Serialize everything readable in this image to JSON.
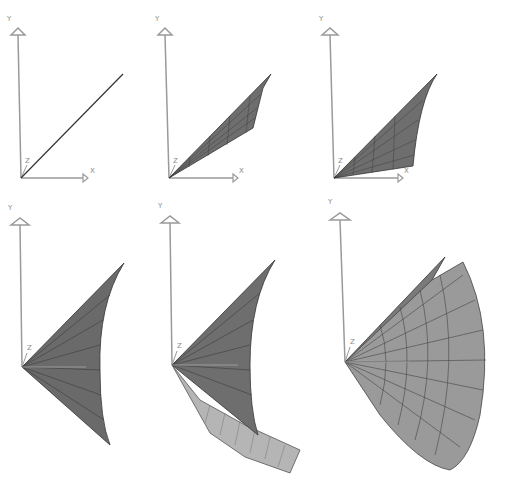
{
  "figure": {
    "colors": {
      "axis": "#9a9a9a",
      "surface_dark": "#6e6e6e",
      "surface_mid": "#8c8c8c",
      "surface_light": "#b5b5b5",
      "mesh_line": "#333333",
      "background": "#ffffff"
    },
    "panels": [
      {
        "id": 1,
        "row": 1,
        "col": 1,
        "stage": "line",
        "axes": {
          "y": "Y",
          "x": "X",
          "z": "Z"
        }
      },
      {
        "id": 2,
        "row": 1,
        "col": 2,
        "stage": "thin-sweep",
        "axes": {
          "y": "Y",
          "x": "X",
          "z": "Z"
        }
      },
      {
        "id": 3,
        "row": 1,
        "col": 3,
        "stage": "wider-sweep",
        "axes": {
          "y": "Y",
          "x": "X",
          "z": "Z"
        }
      },
      {
        "id": 4,
        "row": 2,
        "col": 1,
        "stage": "fan-surface",
        "axes": {
          "y": "Y",
          "z": "Z"
        }
      },
      {
        "id": 5,
        "row": 2,
        "col": 2,
        "stage": "fan-with-fold",
        "axes": {
          "y": "Y",
          "z": "Z"
        }
      },
      {
        "id": 6,
        "row": 2,
        "col": 3,
        "stage": "full-revolution",
        "axes": {
          "y": "Y",
          "z": "Z"
        }
      }
    ]
  }
}
